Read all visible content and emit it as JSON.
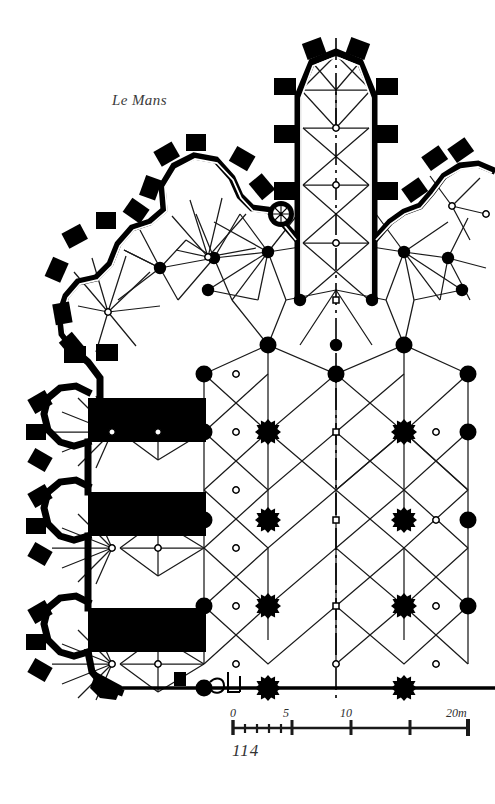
{
  "figure": {
    "title": "Le Mans",
    "page_number": "114",
    "type": "architectural-floor-plan",
    "ink_color": "#000000",
    "paper_color": "#ffffff"
  },
  "scale_bar": {
    "ticks": [
      {
        "label": "0",
        "meters": 0
      },
      {
        "label": "5",
        "meters": 5
      },
      {
        "label": "10",
        "meters": 10
      },
      {
        "label": "20m",
        "meters": 20
      }
    ],
    "minor_subdivision_meters": 1,
    "minor_range_meters": 5,
    "total_meters": 20,
    "unit": "m"
  },
  "plan_elements": {
    "axis": {
      "name": "centre-line",
      "style": "dash-dot",
      "x": 336
    },
    "pier_types": [
      {
        "name": "compound-pier",
        "symbol": "star",
        "count": 12
      },
      {
        "name": "round-pier",
        "symbol": "filled-circle",
        "count": 22
      },
      {
        "name": "vault-boss",
        "symbol": "small-open-circle",
        "count": 26
      }
    ],
    "chapels": [
      {
        "name": "axial-chapel",
        "shape": "polygonal-apse",
        "bays": 3
      },
      {
        "name": "radiating-chapel-upper-left",
        "shape": "polygonal-apse"
      },
      {
        "name": "radiating-chapel-mid-left",
        "shape": "polygonal-apse"
      },
      {
        "name": "radiating-chapel-lower-left-1",
        "shape": "polygonal-apse"
      },
      {
        "name": "radiating-chapel-lower-left-2",
        "shape": "polygonal-apse"
      },
      {
        "name": "radiating-chapel-lower-left-3",
        "shape": "polygonal-apse"
      },
      {
        "name": "radiating-chapel-right",
        "shape": "polygonal-apse"
      }
    ],
    "stair_turrets": [
      {
        "name": "ambulatory-newel-stair",
        "x": 281,
        "y": 214
      },
      {
        "name": "south-west-spiral-stair",
        "x": 110,
        "y": 684
      }
    ],
    "buttress_count": 34,
    "solid_wall_blocks": 3
  }
}
